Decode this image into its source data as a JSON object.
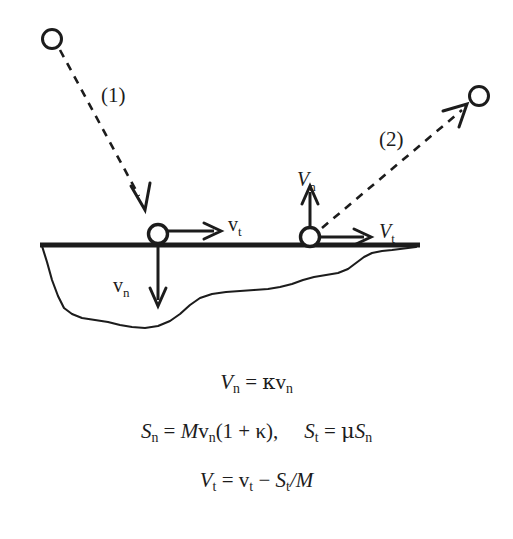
{
  "figure": {
    "background_color": "#ffffff",
    "ink_color": "#1c1c1c"
  },
  "diagram": {
    "trajectories": [
      {
        "id": "incoming",
        "label": "(1)",
        "style": "dashed-arrow",
        "from": "upper-left-particle",
        "to": "left-impact-point"
      },
      {
        "id": "outgoing",
        "label": "(2)",
        "style": "dashed-arrow",
        "from": "right-impact-point",
        "to": "upper-right-particle"
      }
    ],
    "particles": [
      {
        "id": "upper-left-particle",
        "state": "before impact"
      },
      {
        "id": "left-impact-point",
        "state": "at impact, incoming"
      },
      {
        "id": "right-impact-point",
        "state": "at impact, outgoing"
      },
      {
        "id": "upper-right-particle",
        "state": "after rebound"
      }
    ],
    "vectors": [
      {
        "id": "v-t-incoming",
        "symbol": "v",
        "symbol_style": "upright",
        "subscript": "t",
        "direction": "right",
        "at": "left-impact-point",
        "meaning": "incoming tangential velocity"
      },
      {
        "id": "v-n-incoming",
        "symbol": "v",
        "symbol_style": "upright",
        "subscript": "n",
        "direction": "down",
        "at": "left-impact-point",
        "meaning": "incoming normal velocity"
      },
      {
        "id": "V-n-outgoing",
        "symbol": "V",
        "symbol_style": "italic",
        "subscript": "n",
        "direction": "up",
        "at": "right-impact-point",
        "meaning": "rebound normal velocity"
      },
      {
        "id": "V-t-outgoing",
        "symbol": "V",
        "symbol_style": "italic",
        "subscript": "t",
        "direction": "right",
        "at": "right-impact-point",
        "meaning": "rebound tangential velocity"
      }
    ],
    "surface": {
      "id": "ground-surface-line",
      "description": "thick horizontal impact surface"
    },
    "terrain": {
      "id": "terrain-profile",
      "description": "irregular basin / crater cross-section below the surface line"
    }
  },
  "equations": {
    "eq1": {
      "lhs_symbol": "V",
      "lhs_sub": "n",
      "rel": "=",
      "rhs_coeff": "κ",
      "rhs_symbol": "v",
      "rhs_sub": "n",
      "plain": "V_n = κv_n"
    },
    "eq2a": {
      "lhs_symbol": "S",
      "lhs_sub": "n",
      "rel": "=",
      "mass": "M",
      "vel_symbol": "v",
      "vel_sub": "n",
      "factor": "(1 + κ),",
      "plain": "S_n = Mv_n(1 + κ),"
    },
    "eq2b": {
      "lhs_symbol": "S",
      "lhs_sub": "t",
      "rel": "=",
      "coeff": "μ",
      "rhs_symbol": "S",
      "rhs_sub": "n",
      "plain": "S_t = μS_n"
    },
    "eq3": {
      "lhs_symbol": "V",
      "lhs_sub": "t",
      "rel": "=",
      "term1_symbol": "v",
      "term1_sub": "t",
      "op": "−",
      "term2_symbol": "S",
      "term2_sub": "t",
      "divider": "/",
      "mass": "M",
      "plain": "V_t = v_t − S_t/M"
    }
  }
}
